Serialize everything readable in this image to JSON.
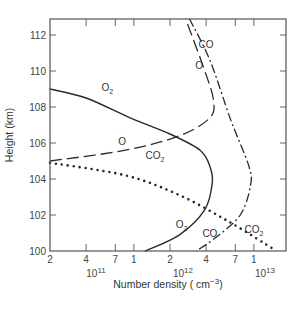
{
  "chart_data": {
    "type": "line",
    "title": "",
    "xlabel": "Number density (cm⁻³)",
    "ylabel": "Height (km)",
    "x_scale": "log",
    "xlim": [
      200000000000.0,
      18500000000000.0
    ],
    "ylim": [
      100,
      113
    ],
    "grid": false,
    "legend": "inline curve labels",
    "y_ticks": [
      100,
      102,
      104,
      106,
      108,
      110,
      112
    ],
    "x_ticks": [
      {
        "value": 200000000000.0,
        "label": "2"
      },
      {
        "value": 400000000000.0,
        "label": "4"
      },
      {
        "value": 700000000000.0,
        "label": "7"
      },
      {
        "value": 1000000000000.0,
        "label": "1"
      },
      {
        "value": 2000000000000.0,
        "label": "2"
      },
      {
        "value": 4000000000000.0,
        "label": "4"
      },
      {
        "value": 7000000000000.0,
        "label": "7"
      },
      {
        "value": 10000000000000.0,
        "label": "1"
      }
    ],
    "x_decade_labels": [
      {
        "value": 100000000000.0,
        "base": "10",
        "exp": "11"
      },
      {
        "value": 1000000000000.0,
        "base": "10",
        "exp": "12"
      },
      {
        "value": 10000000000000.0,
        "base": "10",
        "exp": "13"
      }
    ],
    "series": [
      {
        "name": "O2",
        "style": "solid",
        "points": [
          [
            200000000000.0,
            109
          ],
          [
            400000000000.0,
            108.5
          ],
          [
            930000000000.0,
            107.4
          ],
          [
            2000000000000.0,
            106.5
          ],
          [
            3560000000000.0,
            105.6
          ],
          [
            4300000000000.0,
            104.7
          ],
          [
            4500000000000.0,
            103.8
          ],
          [
            3900000000000.0,
            102.3
          ],
          [
            2400000000000.0,
            100.9
          ],
          [
            1240000000000.0,
            100
          ]
        ]
      },
      {
        "name": "O",
        "style": "long-dash",
        "points": [
          [
            200000000000.0,
            105
          ],
          [
            850000000000.0,
            105.6
          ],
          [
            2400000000000.0,
            106.4
          ],
          [
            4300000000000.0,
            107.4
          ],
          [
            4600000000000.0,
            108.4
          ],
          [
            3900000000000.0,
            110
          ],
          [
            2700000000000.0,
            112.9
          ]
        ]
      },
      {
        "name": "CO",
        "style": "dash-dot",
        "points": [
          [
            2900000000000.0,
            112.9
          ],
          [
            4300000000000.0,
            110.6
          ],
          [
            6400000000000.0,
            107.3
          ],
          [
            9000000000000.0,
            104.8
          ],
          [
            9400000000000.0,
            103.7
          ],
          [
            7700000000000.0,
            102
          ],
          [
            4700000000000.0,
            100.7
          ],
          [
            3300000000000.0,
            100
          ]
        ]
      },
      {
        "name": "CO2",
        "style": "dotted",
        "points": [
          [
            200000000000.0,
            104.9
          ],
          [
            850000000000.0,
            104.2
          ],
          [
            2400000000000.0,
            103.1
          ],
          [
            6300000000000.0,
            101.6
          ],
          [
            14600000000000.0,
            100.1
          ]
        ]
      }
    ],
    "annotations": [
      {
        "text": "O₂",
        "x": 600000000000.0,
        "y": 108.9
      },
      {
        "text": "O",
        "x": 800000000000.0,
        "y": 105.9
      },
      {
        "text": "CO₂",
        "x": 1500000000000.0,
        "y": 105.1
      },
      {
        "text": "CO",
        "x": 4000000000000.0,
        "y": 111.3
      },
      {
        "text": "O",
        "x": 3500000000000.0,
        "y": 110.1
      },
      {
        "text": "O₂",
        "x": 2500000000000.0,
        "y": 101.3
      },
      {
        "text": "CO",
        "x": 4300000000000.0,
        "y": 100.8
      },
      {
        "text": "CO₂",
        "x": 10000000000000.0,
        "y": 101.0
      }
    ]
  },
  "labels": {
    "ylabel": "Height (km)",
    "xlabel_main": "Number density ( cm",
    "xlabel_exp": "−3",
    "xlabel_close": ")"
  }
}
